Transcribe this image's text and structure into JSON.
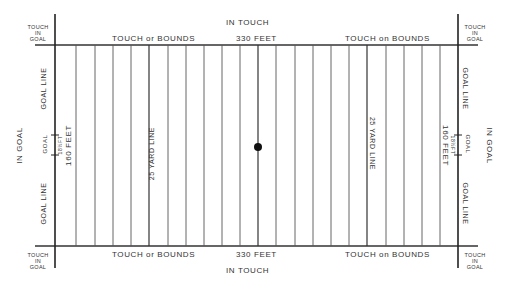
{
  "diagram": {
    "type": "rugby-field-plan",
    "colors": {
      "background": "#ffffff",
      "line": "#333333",
      "text": "#333333",
      "spot": "#111111"
    },
    "top": {
      "in_touch": "IN TOUCH",
      "touch_in_goal_left": [
        "TOUCH",
        "IN",
        "GOAL"
      ],
      "touch_in_goal_right": [
        "TOUCH",
        "IN",
        "GOAL"
      ],
      "touch_or_bounds_left": "TOUCH or BOUNDS",
      "length": "330 FEET",
      "touch_or_bounds_right": "TOUCH on BOUNDS"
    },
    "bottom": {
      "in_touch": "IN TOUCH",
      "touch_in_goal_left": [
        "TOUCH",
        "IN",
        "GOAL"
      ],
      "touch_in_goal_right": [
        "TOUCH",
        "IN",
        "GOAL"
      ],
      "touch_or_bounds_left": "TOUCH or BOUNDS",
      "length": "330 FEET",
      "touch_or_bounds_right": "TOUCH on BOUNDS"
    },
    "left": {
      "in_goal": "IN GOAL",
      "goal_line_upper": "GOAL LINE",
      "goal_line_lower": "GOAL LINE",
      "goal": "GOAL",
      "goal_width": "18½FT",
      "width": "160 FEET",
      "yard_line": "25 YARD LINE"
    },
    "right": {
      "in_goal": "IN GOAL",
      "goal_line_upper": "GOAL LINE",
      "goal_line_lower": "GOAL LINE",
      "goal": "GOAL",
      "goal_width": "18½FT",
      "width": "160 FEET",
      "yard_line": "25 YARD LINE"
    }
  }
}
